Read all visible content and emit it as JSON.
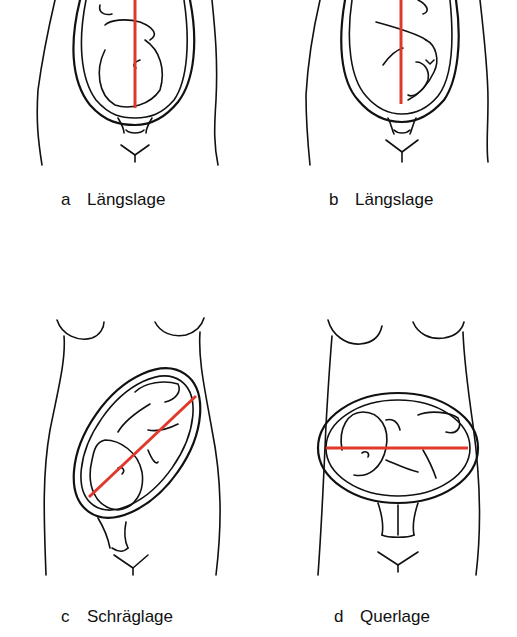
{
  "figure": {
    "panels": [
      {
        "letter": "a",
        "label": "Längslage",
        "axis_orientation": "vertical"
      },
      {
        "letter": "b",
        "label": "Längslage",
        "axis_orientation": "vertical"
      },
      {
        "letter": "c",
        "label": "Schräglage",
        "axis_orientation": "oblique"
      },
      {
        "letter": "d",
        "label": "Querlage",
        "axis_orientation": "horizontal"
      }
    ],
    "colors": {
      "axis_line": "#e0382a",
      "ink": "#111111",
      "background": "#ffffff"
    }
  }
}
